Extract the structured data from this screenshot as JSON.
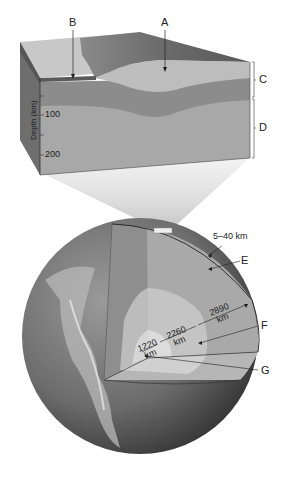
{
  "diagram": {
    "block": {
      "labels": {
        "A": "A",
        "B": "B",
        "C": "C",
        "D": "D"
      },
      "depth_axis": {
        "title": "Depth (km)",
        "ticks": [
          "100",
          "200"
        ]
      }
    },
    "globe": {
      "labels": {
        "E": "E",
        "F": "F",
        "G": "G"
      },
      "dimensions": {
        "crust": "5–40 km",
        "mantle": "2890",
        "outer_core": "2260",
        "inner_core": "1220",
        "unit": "km"
      }
    },
    "colors": {
      "sky_beam": "#e8e8e8",
      "continental": "#b8b8b8",
      "terrain": "#7a7a7a",
      "oceanic_top": "#c9c9c9",
      "lithosphere_band": "#8c8c8c",
      "asthenosphere": "#a8a8a8",
      "block_side": "#6e6e6e",
      "globe_dark": "#4a4a4a",
      "mantle": "#a9a9a9",
      "outer_core": "#c4c4c4",
      "inner_core": "#dcdcdc"
    }
  }
}
